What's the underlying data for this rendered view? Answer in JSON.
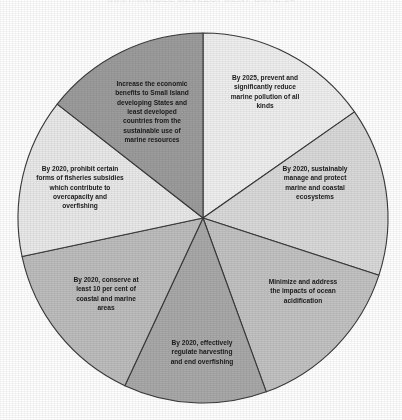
{
  "chart_title": "SUSTAINABLE DEVELOPMENT GOAL 14",
  "chart_data": {
    "type": "pie",
    "title": "SUSTAINABLE DEVELOPMENT GOAL 14",
    "subtitle": "",
    "xlabel": "",
    "ylabel": "",
    "legend_position": "none",
    "grid": false,
    "labels_inside_slices": true,
    "total_slices": 7,
    "center": {
      "x": 203,
      "y": 218
    },
    "radius": 185,
    "start_angle_deg": 0,
    "direction": "clockwise",
    "categories": [
      "By 2025, prevent and significantly reduce marine pollution of all kinds",
      "By 2020, sustainably manage and protect marine and coastal ecosystems",
      "Minimize and address the impacts of ocean acidification",
      "By 2020, effectively regulate harvesting and end overfishing",
      "By 2020, conserve at least 10 per cent of coastal and marine areas",
      "By 2020, prohibit certain forms of fisheries subsidies which contribute to overcapacity and overfishing",
      "Increase the economic benefits to Small Island developing States and least developed countries from the sustainable use of marine resources"
    ],
    "values": [
      55,
      53,
      52,
      45,
      53,
      50,
      52
    ],
    "colors": [
      "#efefef",
      "#d9d9d9",
      "#c2c2c2",
      "#a9a9a9",
      "#bdbdbd",
      "#e9e9e9",
      "#9c9c9c"
    ],
    "stroke_color": "#3a3a3a"
  },
  "slices": [
    {
      "id": "marine-pollution",
      "label": "By 2025, prevent and\nsignificantly reduce\nmarine pollution of all\nkinds",
      "value": 55,
      "start_deg": 0,
      "end_deg": 55,
      "color": "#efefef",
      "label_x": 265,
      "label_y": 92,
      "label_width": 110
    },
    {
      "id": "manage-protect-ecosystems",
      "label": "By 2020, sustainably\nmanage and protect\nmarine and coastal\necosystems",
      "value": 53,
      "start_deg": 55,
      "end_deg": 108,
      "color": "#d9d9d9",
      "label_x": 315,
      "label_y": 183,
      "label_width": 105
    },
    {
      "id": "ocean-acidification",
      "label": "Minimize and address\nthe impacts of ocean\nacidification",
      "value": 52,
      "start_deg": 108,
      "end_deg": 160,
      "color": "#c2c2c2",
      "label_x": 303,
      "label_y": 291,
      "label_width": 110
    },
    {
      "id": "regulate-harvesting",
      "label": "By 2020, effectively\nregulate harvesting\nand end overfishing",
      "value": 45,
      "start_deg": 160,
      "end_deg": 205,
      "color": "#a9a9a9",
      "label_x": 202,
      "label_y": 352,
      "label_width": 108
    },
    {
      "id": "conserve-coastal-marine",
      "label": "By 2020, conserve at\nleast 10 per cent of\ncoastal and marine\nareas",
      "value": 53,
      "start_deg": 205,
      "end_deg": 258,
      "color": "#bdbdbd",
      "label_x": 106,
      "label_y": 294,
      "label_width": 106
    },
    {
      "id": "fisheries-subsidies",
      "label": "By 2020, prohibit certain\nforms of fisheries subsidies\nwhich contribute to\novercapacity and\noverfishing",
      "value": 50,
      "start_deg": 258,
      "end_deg": 308,
      "color": "#e9e9e9",
      "label_x": 80,
      "label_y": 187,
      "label_width": 132
    },
    {
      "id": "small-island-benefits",
      "label": "Increase the economic\nbenefits to Small Island\ndeveloping States and\nleast developed\ncountries from the\nsustainable use of\nmarine resources",
      "value": 52,
      "start_deg": 308,
      "end_deg": 360,
      "color": "#9c9c9c",
      "label_x": 152,
      "label_y": 112,
      "label_width": 112
    }
  ]
}
